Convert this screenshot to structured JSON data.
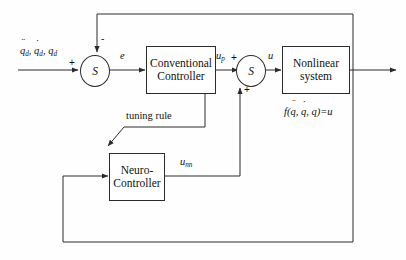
{
  "diagram": {
    "blocks": {
      "conventional_controller": {
        "line1": "Conventional",
        "line2": "Controller"
      },
      "nonlinear_system": {
        "line1": "Nonlinear",
        "line2": "system"
      },
      "neuro_controller": {
        "line1": "Neuro-",
        "line2": "Controller"
      },
      "sum_left": {
        "label": "S"
      },
      "sum_right": {
        "label": "S"
      }
    },
    "signals": {
      "reference": {
        "q_ddot": "q",
        "q_dot": "q",
        "q": "q",
        "subscript": "d",
        "sep": ", "
      },
      "error": "e",
      "u_p": {
        "base": "u",
        "sub": "p"
      },
      "u": "u",
      "u_nn": {
        "base": "u",
        "sub": "nn"
      },
      "tuning_rule": "tuning rule",
      "plant_equation": {
        "prefix": "f(",
        "q_ddot": "q",
        "q_dot": "q",
        "q": "q",
        "sep": ", ",
        "suffix": ")=u"
      }
    },
    "signs": {
      "sum_left_plus": "+",
      "sum_left_minus": "-",
      "sum_right_plus_in": "+",
      "sum_right_plus_bottom": "+"
    },
    "colors": {
      "line": "#2b2b2b",
      "background": "#fefefe",
      "text": "#111111"
    }
  }
}
